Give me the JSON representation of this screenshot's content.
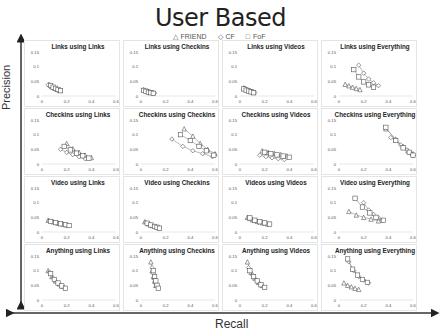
{
  "chart_data": {
    "type": "scatter",
    "title": "User Based",
    "xlabel": "Recall",
    "ylabel": "Precision",
    "legend": [
      "FRIEND",
      "CF",
      "FoF"
    ],
    "legend_markers": [
      "triangle",
      "diamond",
      "square"
    ],
    "xlim": [
      0,
      0.6
    ],
    "ylim": [
      0,
      0.15
    ],
    "xticks": [
      "0",
      "0.2",
      "0.4",
      "0.6"
    ],
    "yticks": [
      "0",
      "0.05",
      "0.1",
      "0.15"
    ],
    "grid_rows": 4,
    "grid_cols": 4,
    "panels": [
      {
        "title": "Links using Links",
        "series": [
          {
            "name": "FRIEND",
            "x": [
              0.06,
              0.08,
              0.1,
              0.12,
              0.14
            ],
            "y": [
              0.04,
              0.033,
              0.028,
              0.024,
              0.02
            ]
          },
          {
            "name": "CF",
            "x": [
              0.05,
              0.07,
              0.09,
              0.11,
              0.13
            ],
            "y": [
              0.038,
              0.031,
              0.027,
              0.023,
              0.019
            ]
          },
          {
            "name": "FoF",
            "x": [
              0.07,
              0.09,
              0.11,
              0.13,
              0.15
            ],
            "y": [
              0.036,
              0.03,
              0.026,
              0.022,
              0.018
            ]
          }
        ]
      },
      {
        "title": "Links using Checkins",
        "series": [
          {
            "name": "FRIEND",
            "x": [
              0.02,
              0.04,
              0.06,
              0.08,
              0.1
            ],
            "y": [
              0.022,
              0.018,
              0.015,
              0.013,
              0.011
            ]
          },
          {
            "name": "CF",
            "x": [
              0.03,
              0.05,
              0.07,
              0.09,
              0.11
            ],
            "y": [
              0.02,
              0.017,
              0.014,
              0.012,
              0.01
            ]
          },
          {
            "name": "FoF",
            "x": [
              0.02,
              0.04,
              0.06,
              0.08,
              0.1
            ],
            "y": [
              0.019,
              0.016,
              0.013,
              0.011,
              0.009
            ]
          }
        ]
      },
      {
        "title": "Links using Videos",
        "series": [
          {
            "name": "FRIEND",
            "x": [
              0.03,
              0.05,
              0.07,
              0.09,
              0.11
            ],
            "y": [
              0.028,
              0.023,
              0.019,
              0.016,
              0.013
            ]
          },
          {
            "name": "CF",
            "x": [
              0.04,
              0.06,
              0.08,
              0.1,
              0.12
            ],
            "y": [
              0.026,
              0.021,
              0.018,
              0.015,
              0.012
            ]
          },
          {
            "name": "FoF",
            "x": [
              0.03,
              0.05,
              0.07,
              0.09,
              0.11
            ],
            "y": [
              0.024,
              0.02,
              0.017,
              0.014,
              0.011
            ]
          }
        ]
      },
      {
        "title": "Links using Everything",
        "series": [
          {
            "name": "FRIEND",
            "x": [
              0.05,
              0.08,
              0.11,
              0.14,
              0.17
            ],
            "y": [
              0.04,
              0.035,
              0.03,
              0.026,
              0.022
            ]
          },
          {
            "name": "CF",
            "x": [
              0.16,
              0.2,
              0.24,
              0.28,
              0.32
            ],
            "y": [
              0.105,
              0.078,
              0.058,
              0.045,
              0.035
            ]
          },
          {
            "name": "FoF",
            "x": [
              0.12,
              0.16,
              0.2,
              0.24,
              0.28
            ],
            "y": [
              0.09,
              0.065,
              0.048,
              0.038,
              0.03
            ]
          }
        ]
      },
      {
        "title": "Checkins using Links",
        "series": [
          {
            "name": "FRIEND",
            "x": [
              0.2,
              0.25,
              0.3,
              0.35,
              0.4
            ],
            "y": [
              0.07,
              0.052,
              0.04,
              0.03,
              0.022
            ]
          },
          {
            "name": "CF",
            "x": [
              0.15,
              0.2,
              0.25,
              0.3,
              0.35
            ],
            "y": [
              0.05,
              0.04,
              0.032,
              0.025,
              0.018
            ]
          },
          {
            "name": "FoF",
            "x": [
              0.18,
              0.23,
              0.28,
              0.33,
              0.38
            ],
            "y": [
              0.06,
              0.048,
              0.037,
              0.028,
              0.02
            ]
          }
        ]
      },
      {
        "title": "Checkins using Checkins",
        "series": [
          {
            "name": "FRIEND",
            "x": [
              0.35,
              0.42,
              0.48,
              0.54,
              0.6
            ],
            "y": [
              0.12,
              0.095,
              0.07,
              0.05,
              0.035
            ]
          },
          {
            "name": "CF",
            "x": [
              0.25,
              0.34,
              0.42,
              0.5,
              0.58
            ],
            "y": [
              0.085,
              0.06,
              0.045,
              0.035,
              0.025
            ]
          },
          {
            "name": "FoF",
            "x": [
              0.32,
              0.4,
              0.47,
              0.53,
              0.59
            ],
            "y": [
              0.1,
              0.08,
              0.06,
              0.045,
              0.03
            ]
          }
        ]
      },
      {
        "title": "Checkins using Videos",
        "series": [
          {
            "name": "FRIEND",
            "x": [
              0.18,
              0.23,
              0.28,
              0.33,
              0.38
            ],
            "y": [
              0.045,
              0.04,
              0.036,
              0.032,
              0.028
            ]
          },
          {
            "name": "CF",
            "x": [
              0.16,
              0.21,
              0.26,
              0.31,
              0.36
            ],
            "y": [
              0.03,
              0.025,
              0.021,
              0.018,
              0.015
            ]
          },
          {
            "name": "FoF",
            "x": [
              0.2,
              0.25,
              0.3,
              0.35,
              0.4
            ],
            "y": [
              0.04,
              0.035,
              0.031,
              0.027,
              0.023
            ]
          }
        ]
      },
      {
        "title": "Checkins using Everything",
        "series": [
          {
            "name": "FRIEND",
            "x": [
              0.38,
              0.46,
              0.52,
              0.56,
              0.6
            ],
            "y": [
              0.12,
              0.085,
              0.06,
              0.045,
              0.035
            ]
          },
          {
            "name": "CF",
            "x": [
              0.42,
              0.5,
              0.55,
              0.58,
              0.6
            ],
            "y": [
              0.09,
              0.065,
              0.048,
              0.038,
              0.028
            ]
          },
          {
            "name": "FoF",
            "x": [
              0.38,
              0.46,
              0.52,
              0.57,
              0.6
            ],
            "y": [
              0.125,
              0.08,
              0.055,
              0.04,
              0.03
            ]
          }
        ]
      },
      {
        "title": "Video using Links",
        "series": [
          {
            "name": "FRIEND",
            "x": [
              0.05,
              0.09,
              0.13,
              0.17,
              0.2
            ],
            "y": [
              0.04,
              0.035,
              0.03,
              0.027,
              0.024
            ]
          },
          {
            "name": "CF",
            "x": [
              0.06,
              0.1,
              0.14,
              0.18,
              0.21
            ],
            "y": [
              0.038,
              0.033,
              0.029,
              0.026,
              0.023
            ]
          },
          {
            "name": "FoF",
            "x": [
              0.07,
              0.11,
              0.15,
              0.19,
              0.22
            ],
            "y": [
              0.036,
              0.032,
              0.028,
              0.025,
              0.022
            ]
          }
        ]
      },
      {
        "title": "Video using Checkins",
        "series": [
          {
            "name": "FRIEND",
            "x": [
              0.03,
              0.06,
              0.09,
              0.12,
              0.14
            ],
            "y": [
              0.035,
              0.028,
              0.022,
              0.018,
              0.015
            ]
          },
          {
            "name": "CF",
            "x": [
              0.04,
              0.07,
              0.1,
              0.13,
              0.15
            ],
            "y": [
              0.032,
              0.026,
              0.021,
              0.017,
              0.014
            ]
          },
          {
            "name": "FoF",
            "x": [
              0.05,
              0.08,
              0.11,
              0.13,
              0.15
            ],
            "y": [
              0.03,
              0.024,
              0.019,
              0.016,
              0.013
            ]
          }
        ]
      },
      {
        "title": "Videos using Videos",
        "series": [
          {
            "name": "FRIEND",
            "x": [
              0.06,
              0.1,
              0.14,
              0.18,
              0.22
            ],
            "y": [
              0.05,
              0.042,
              0.036,
              0.032,
              0.028
            ]
          },
          {
            "name": "CF",
            "x": [
              0.07,
              0.11,
              0.15,
              0.19,
              0.23
            ],
            "y": [
              0.045,
              0.038,
              0.033,
              0.029,
              0.026
            ]
          },
          {
            "name": "FoF",
            "x": [
              0.08,
              0.12,
              0.16,
              0.2,
              0.24
            ],
            "y": [
              0.048,
              0.04,
              0.035,
              0.031,
              0.027
            ]
          }
        ]
      },
      {
        "title": "Video using Everything",
        "series": [
          {
            "name": "FRIEND",
            "x": [
              0.08,
              0.14,
              0.2,
              0.26,
              0.32
            ],
            "y": [
              0.07,
              0.058,
              0.05,
              0.044,
              0.038
            ]
          },
          {
            "name": "CF",
            "x": [
              0.2,
              0.24,
              0.28,
              0.32,
              0.35
            ],
            "y": [
              0.1,
              0.075,
              0.06,
              0.048,
              0.04
            ]
          },
          {
            "name": "FoF",
            "x": [
              0.13,
              0.19,
              0.25,
              0.3,
              0.36
            ],
            "y": [
              0.115,
              0.085,
              0.065,
              0.05,
              0.04
            ]
          }
        ]
      },
      {
        "title": "Anything using Links",
        "series": [
          {
            "name": "FRIEND",
            "x": [
              0.05,
              0.08,
              0.11,
              0.14,
              0.17
            ],
            "y": [
              0.1,
              0.08,
              0.065,
              0.055,
              0.047
            ]
          },
          {
            "name": "CF",
            "x": [
              0.06,
              0.09,
              0.12,
              0.15,
              0.18
            ],
            "y": [
              0.095,
              0.075,
              0.06,
              0.05,
              0.043
            ]
          },
          {
            "name": "FoF",
            "x": [
              0.07,
              0.1,
              0.13,
              0.16,
              0.19
            ],
            "y": [
              0.09,
              0.07,
              0.058,
              0.048,
              0.04
            ]
          }
        ]
      },
      {
        "title": "Anything using Checkins",
        "series": [
          {
            "name": "FRIEND",
            "x": [
              0.08,
              0.09,
              0.1,
              0.11,
              0.12
            ],
            "y": [
              0.13,
              0.1,
              0.08,
              0.065,
              0.05
            ]
          },
          {
            "name": "CF",
            "x": [
              0.09,
              0.1,
              0.11,
              0.12,
              0.13
            ],
            "y": [
              0.11,
              0.09,
              0.07,
              0.055,
              0.045
            ]
          },
          {
            "name": "FoF",
            "x": [
              0.1,
              0.11,
              0.12,
              0.13,
              0.14
            ],
            "y": [
              0.1,
              0.08,
              0.065,
              0.05,
              0.04
            ]
          }
        ]
      },
      {
        "title": "Anything using Videos",
        "series": [
          {
            "name": "FRIEND",
            "x": [
              0.06,
              0.09,
              0.12,
              0.15,
              0.18
            ],
            "y": [
              0.13,
              0.095,
              0.075,
              0.06,
              0.05
            ]
          },
          {
            "name": "CF",
            "x": [
              0.07,
              0.1,
              0.13,
              0.16,
              0.19
            ],
            "y": [
              0.11,
              0.085,
              0.068,
              0.055,
              0.045
            ]
          },
          {
            "name": "FoF",
            "x": [
              0.08,
              0.11,
              0.14,
              0.17,
              0.2
            ],
            "y": [
              0.1,
              0.08,
              0.065,
              0.052,
              0.043
            ]
          }
        ]
      },
      {
        "title": "Anything using Everything",
        "series": [
          {
            "name": "FRIEND",
            "x": [
              0.04,
              0.07,
              0.1,
              0.13,
              0.16
            ],
            "y": [
              0.058,
              0.05,
              0.045,
              0.04,
              0.036
            ]
          },
          {
            "name": "CF",
            "x": [
              0.08,
              0.12,
              0.16,
              0.2,
              0.24
            ],
            "y": [
              0.13,
              0.1,
              0.08,
              0.068,
              0.058
            ]
          },
          {
            "name": "FoF",
            "x": [
              0.07,
              0.11,
              0.15,
              0.19,
              0.23
            ],
            "y": [
              0.14,
              0.105,
              0.085,
              0.07,
              0.06
            ]
          }
        ]
      }
    ]
  }
}
